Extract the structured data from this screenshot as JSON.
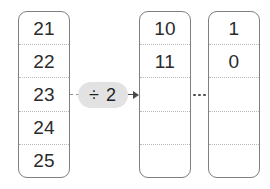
{
  "diagram": {
    "type": "array-division-diagram",
    "operator": {
      "label": "÷ 2",
      "badge_color": "#e2e2e2",
      "text_color": "#1f1f1f"
    },
    "ellipsis": {
      "label": "…",
      "dot_count": 3,
      "color": "#4c4c4c"
    },
    "colors": {
      "column_border": "#7f7f7f",
      "cell_divider": "#b9b9b9",
      "value_text": "#2b2b2b",
      "arrow": "#4a4a4a",
      "background": "#ffffff"
    },
    "columns": [
      {
        "name": "source-column",
        "cells": [
          {
            "value": "21",
            "empty": false
          },
          {
            "value": "22",
            "empty": false
          },
          {
            "value": "23",
            "empty": false
          },
          {
            "value": "24",
            "empty": false
          },
          {
            "value": "25",
            "empty": false
          }
        ]
      },
      {
        "name": "intermediate-column",
        "cells": [
          {
            "value": "10",
            "empty": false
          },
          {
            "value": "11",
            "empty": false
          },
          {
            "value": "",
            "empty": true
          },
          {
            "value": "",
            "empty": true
          },
          {
            "value": "",
            "empty": true
          }
        ]
      },
      {
        "name": "result-column",
        "cells": [
          {
            "value": "1",
            "empty": false
          },
          {
            "value": "0",
            "empty": false
          },
          {
            "value": "",
            "empty": true
          },
          {
            "value": "",
            "empty": true
          },
          {
            "value": "",
            "empty": true
          }
        ]
      }
    ]
  }
}
